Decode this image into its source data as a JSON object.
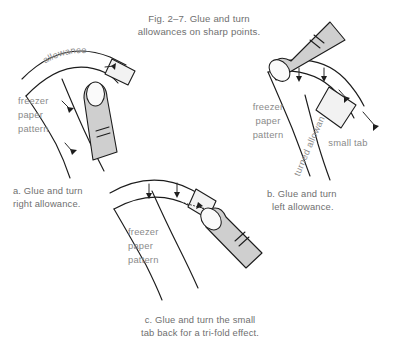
{
  "figure": {
    "title_line1": "Fig. 2–7. Glue and turn",
    "title_line2": "allowances on sharp points.",
    "background_color": "#ffffff",
    "ink_color": "#1c1c1c",
    "text_color": "#6f6f6f",
    "label_color": "#8a8a8a",
    "tab_fill": "#f2f2f2",
    "thumb_fill": "#cfcfcf"
  },
  "panel_a": {
    "caption_line1": "a. Glue and turn",
    "caption_line2": "right allowance.",
    "label_allowance": "allowance",
    "label_pattern_line1": "freezer",
    "label_pattern_line2": "paper",
    "label_pattern_line3": "pattern"
  },
  "panel_b": {
    "caption_line1": "b. Glue and turn",
    "caption_line2": "left allowance.",
    "label_small_tab": "small tab",
    "label_turned_allowance": "turned allowance",
    "label_pattern_line1": "freezer",
    "label_pattern_line2": "paper",
    "label_pattern_line3": "pattern"
  },
  "panel_c": {
    "caption_line1": "c. Glue and turn the small",
    "caption_line2": "tab back for a tri-fold effect.",
    "label_pattern_line1": "freezer",
    "label_pattern_line2": "paper",
    "label_pattern_line3": "pattern"
  }
}
